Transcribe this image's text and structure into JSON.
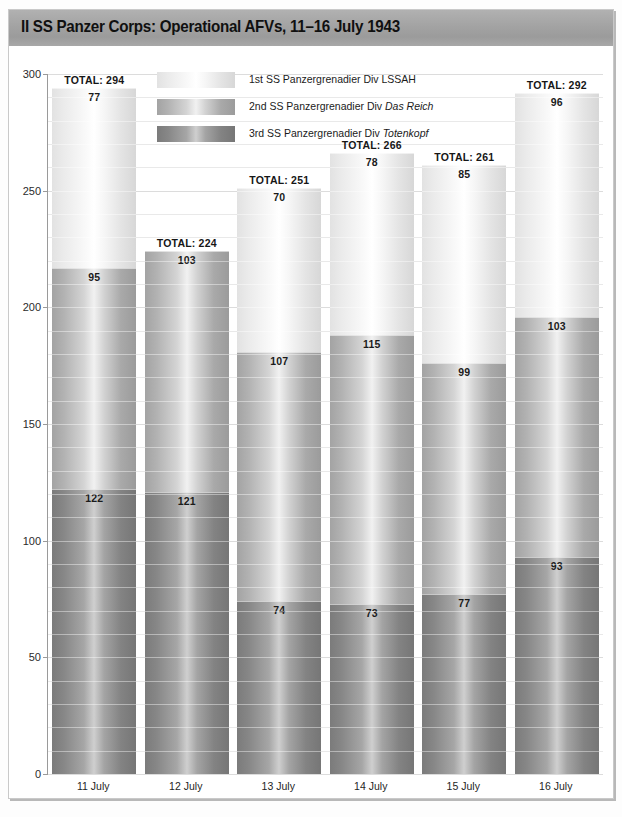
{
  "title": "II SS Panzer Corps: Operational AFVs, 11–16 July 1943",
  "legend": [
    {
      "key": "s1",
      "prefix": "1st SS Panzergrenadier Div ",
      "name": "LSSAH",
      "italic": false
    },
    {
      "key": "s2",
      "prefix": "2nd SS Panzergrenadier Div ",
      "name": "Das Reich",
      "italic": true
    },
    {
      "key": "s3",
      "prefix": "3rd SS Panzergrenadier Div ",
      "name": "Totenkopf",
      "italic": true
    }
  ],
  "chart_data": {
    "type": "bar",
    "subtype": "stacked-column",
    "title": "II SS Panzer Corps: Operational AFVs, 11–16 July 1943",
    "xlabel": "",
    "ylabel": "",
    "ylim": [
      0,
      300
    ],
    "yticks": [
      0,
      50,
      100,
      150,
      200,
      250,
      300
    ],
    "ytick_labels": [
      "0",
      "50",
      "100",
      "150",
      "200",
      "250",
      "300"
    ],
    "minor_gridline_step": 10,
    "grid": true,
    "legend_position": "top-center",
    "categories": [
      "11 July",
      "12 July",
      "13 July",
      "14 July",
      "15 July",
      "16 July"
    ],
    "series": [
      {
        "name": "1st SS Panzergrenadier Div LSSAH",
        "key": "s1",
        "values": [
          77,
          0,
          70,
          78,
          85,
          96
        ]
      },
      {
        "name": "2nd SS Panzergrenadier Div Das Reich",
        "key": "s2",
        "values": [
          95,
          103,
          107,
          115,
          99,
          103
        ]
      },
      {
        "name": "3rd SS Panzergrenadier Div Totenkopf",
        "key": "s3",
        "values": [
          122,
          121,
          74,
          73,
          77,
          93
        ]
      }
    ],
    "totals": [
      294,
      224,
      251,
      266,
      261,
      292
    ],
    "total_label_prefix": "TOTAL: "
  }
}
